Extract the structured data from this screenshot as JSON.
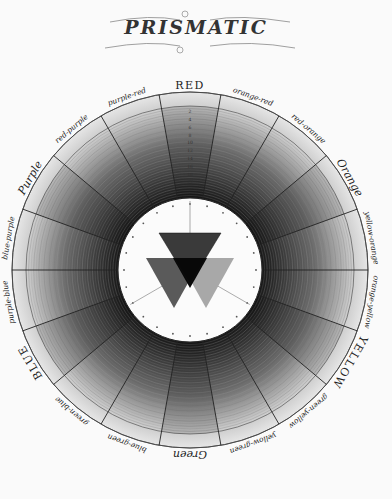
{
  "title": "PRISMATIC",
  "wheel": {
    "center": [
      190,
      270
    ],
    "outer_radius": 178,
    "inner_radius": 72,
    "ring_count": 20,
    "segment_labels": [
      {
        "label": "RED",
        "style": "caps"
      },
      {
        "label": "orange-red",
        "style": "italic"
      },
      {
        "label": "red-orange",
        "style": "italic"
      },
      {
        "label": "Orange",
        "style": "title"
      },
      {
        "label": "yellow-orange",
        "style": "italic"
      },
      {
        "label": "orange-yellow",
        "style": "italic"
      },
      {
        "label": "YELLOW",
        "style": "caps"
      },
      {
        "label": "green-yellow",
        "style": "italic"
      },
      {
        "label": "yellow-green",
        "style": "italic"
      },
      {
        "label": "Green",
        "style": "title"
      },
      {
        "label": "blue-green",
        "style": "italic"
      },
      {
        "label": "green-blue",
        "style": "italic"
      },
      {
        "label": "BLUE",
        "style": "caps"
      },
      {
        "label": "purple-blue",
        "style": "italic"
      },
      {
        "label": "blue-purple",
        "style": "italic"
      },
      {
        "label": "Purple",
        "style": "title"
      },
      {
        "label": "red-purple",
        "style": "italic"
      },
      {
        "label": "purple-red",
        "style": "italic"
      }
    ],
    "scale_numbers": [
      "2",
      "4",
      "6",
      "8",
      "10",
      "12",
      "14",
      "16",
      "18",
      "20"
    ]
  },
  "center_triangles": {
    "top": {
      "name": "red-triangle",
      "fill": "#3a3a3a"
    },
    "left": {
      "name": "blue-triangle",
      "fill": "#5a5a5a"
    },
    "right": {
      "name": "yellow-triangle",
      "fill": "#a8a8a8"
    },
    "overlap": {
      "name": "black-overlap",
      "fill": "#080808"
    }
  },
  "colors": {
    "paper": "#fafafa",
    "ink": "#222222",
    "ring_light": "#e2e2e2",
    "ring_dark": "#1a1a1a"
  }
}
